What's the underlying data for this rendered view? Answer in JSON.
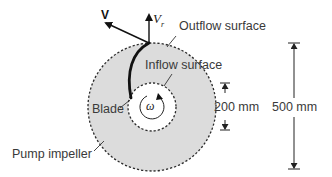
{
  "diagram": {
    "colors": {
      "impeller_fill": "#dcdcdc",
      "inner_fill": "#ffffff",
      "line": "#2a2a2a",
      "text": "#3a3a3a"
    },
    "vectors": {
      "absolute_velocity": "V",
      "radial_velocity_main": "V",
      "radial_velocity_sub": "r"
    },
    "labels": {
      "outflow": "Outflow surface",
      "inflow": "Inflow surface",
      "blade": "Blade",
      "impeller": "Pump impeller",
      "omega": "ω"
    },
    "dimensions": {
      "inner_diameter": "200 mm",
      "outer_diameter": "500 mm"
    }
  }
}
